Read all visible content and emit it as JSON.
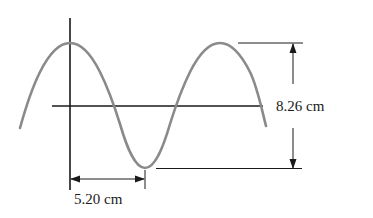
{
  "diagram": {
    "type": "sinusoidal wave with dimension annotations",
    "labels": {
      "amplitude_span": "8.26 cm",
      "half_wavelength": "5.20 cm"
    },
    "colors": {
      "wave": "#8a8a8a",
      "axes": "#1a1a1a",
      "text": "#1a1a1a",
      "background": "#ffffff"
    }
  }
}
